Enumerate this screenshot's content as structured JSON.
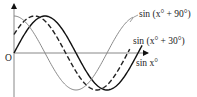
{
  "chart_data": {
    "type": "line",
    "title": "",
    "xlabel": "",
    "ylabel": "",
    "origin_label": "O",
    "grid": false,
    "x_unit": "degrees",
    "x_range": [
      0,
      375
    ],
    "y_range": [
      -1,
      1
    ],
    "series": [
      {
        "name": "sin x°",
        "label": "sin x°",
        "phase_deg": 0,
        "style": "solid",
        "color": "#111111"
      },
      {
        "name": "sin (x° + 30°)",
        "label": "sin (x° + 30°)",
        "phase_deg": 30,
        "style": "dashed",
        "color": "#222222"
      },
      {
        "name": "sin (x° + 90°)",
        "label": "sin (x° + 90°)",
        "phase_deg": 90,
        "style": "solid",
        "color": "#8a8a8a"
      }
    ]
  },
  "labels": {
    "origin": "O",
    "series_90": "sin (x° + 90°)",
    "series_30": "sin (x° + 30°)",
    "series_0": "sin x°"
  }
}
